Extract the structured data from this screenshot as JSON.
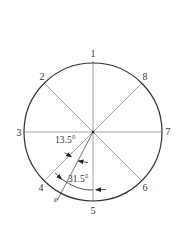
{
  "diagram": {
    "type": "circle with 8 numbered radial positions",
    "center": [
      93,
      132
    ],
    "radius": 69,
    "positions": [
      {
        "label": "1",
        "angle_from_top_ccw_deg": 0
      },
      {
        "label": "2",
        "angle_from_top_ccw_deg": 45
      },
      {
        "label": "3",
        "angle_from_top_ccw_deg": 90
      },
      {
        "label": "4",
        "angle_from_top_ccw_deg": 135
      },
      {
        "label": "5",
        "angle_from_top_ccw_deg": 180
      },
      {
        "label": "6",
        "angle_from_top_ccw_deg": 225
      },
      {
        "label": "7",
        "angle_from_top_ccw_deg": 270
      },
      {
        "label": "8",
        "angle_from_top_ccw_deg": 315
      }
    ],
    "extra_line": {
      "label": "e",
      "angle_from_bottom_cw_deg": 31.5
    },
    "angles": [
      {
        "label": "13.5°",
        "between": [
          "4",
          "e"
        ]
      },
      {
        "label": "31.5°",
        "between": [
          "e",
          "5"
        ]
      }
    ],
    "colors": {
      "circle": "#333333",
      "diameters": "#9a9a9a",
      "e_line": "#555555",
      "text": "#333333"
    }
  },
  "labels": {
    "p1": "1",
    "p2": "2",
    "p3": "3",
    "p4": "4",
    "p5": "5",
    "p6": "6",
    "p7": "7",
    "p8": "8",
    "e": "e",
    "angle_small": "13.5°",
    "angle_large": "31.5°"
  }
}
